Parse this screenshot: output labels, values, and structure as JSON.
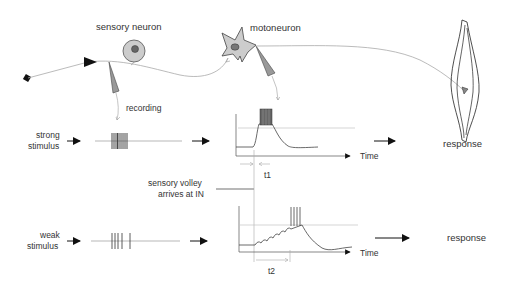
{
  "labels": {
    "sensory_neuron": "sensory neuron",
    "motoneuron": "motoneuron",
    "recording": "recording",
    "strong_stimulus_1": "strong",
    "strong_stimulus_2": "stimulus",
    "weak_stimulus_1": "weak",
    "weak_stimulus_2": "stimulus",
    "sensory_volley_1": "sensory volley",
    "sensory_volley_2": "arrives at IN",
    "time_top": "Time",
    "time_bottom": "Time",
    "t1": "t1",
    "t2": "t2",
    "response_top": "response",
    "response_bottom": "response"
  },
  "colors": {
    "line": "#222222",
    "grey_line": "#999999",
    "light_grey": "#bbbbbb",
    "cell_fill": "#cccccc",
    "nucleus_fill": "#777777"
  },
  "stimuli": {
    "strong": {
      "spike_count": 9,
      "spacing": "dense"
    },
    "weak": {
      "spike_count": 5,
      "spacing": "sparse"
    }
  }
}
